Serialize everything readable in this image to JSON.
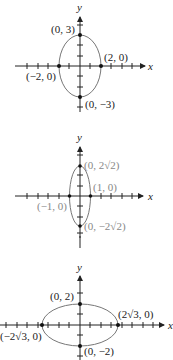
{
  "graphs": [
    {
      "equation_hint": "ellipse a=2 (horizontal), b=3 (vertical)",
      "axis_labels": {
        "x": "x",
        "y": "y"
      },
      "labels": {
        "top": "(0, 3)",
        "bottom": "(0, −3)",
        "left": "(−2, 0)",
        "right": "(2, 0)"
      },
      "vertices": {
        "top": [
          0,
          3
        ],
        "bottom": [
          0,
          -3
        ],
        "left": [
          -2,
          0
        ],
        "right": [
          2,
          0
        ]
      },
      "label_color": "#222222"
    },
    {
      "equation_hint": "ellipse a=1 (horizontal), b=2√2 (vertical)",
      "axis_labels": {
        "x": "x",
        "y": "y"
      },
      "labels": {
        "top": "(0, 2√2)",
        "bottom": "(0, −2√2)",
        "left": "(−1, 0)",
        "right": "(1, 0)"
      },
      "vertices": {
        "top": [
          0,
          2.83
        ],
        "bottom": [
          0,
          -2.83
        ],
        "left": [
          -1,
          0
        ],
        "right": [
          1,
          0
        ]
      },
      "label_color": "#888888"
    },
    {
      "equation_hint": "ellipse a=2√3 (horizontal), b=2 (vertical)",
      "axis_labels": {
        "x": "x",
        "y": "y"
      },
      "labels": {
        "top": "(0, 2)",
        "bottom": "(0, −2)",
        "left": "(−2√3, 0)",
        "right": "(2√3, 0)"
      },
      "vertices": {
        "top": [
          0,
          2
        ],
        "bottom": [
          0,
          -2
        ],
        "left": [
          -3.46,
          0
        ],
        "right": [
          3.46,
          0
        ]
      },
      "label_color": "#222222"
    }
  ]
}
